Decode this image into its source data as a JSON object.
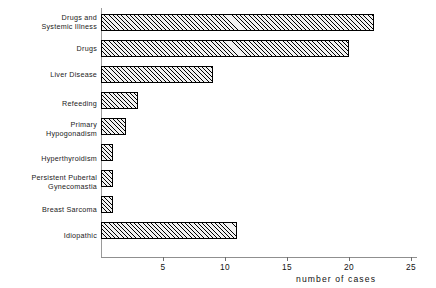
{
  "chart_data": {
    "type": "bar",
    "orientation": "horizontal",
    "title": "",
    "xlabel": "number of cases",
    "ylabel": "",
    "xlim": [
      0,
      27
    ],
    "xticks": [
      5,
      10,
      15,
      20,
      25
    ],
    "xtick_labels": [
      "5",
      "10",
      "15",
      "20",
      "25"
    ],
    "grid": false,
    "legend": null,
    "categories": [
      "Drugs and\nSystemic Illness",
      "Drugs",
      "Liver Disease",
      "Refeeding",
      "Primary\nHypogonadism",
      "Hyperthyroidism",
      "Persistent Pubertal\nGynecomastia",
      "Breast Sarcoma",
      "Idiopathic"
    ],
    "values": [
      22,
      20,
      9,
      3,
      2,
      1,
      1,
      1,
      11
    ],
    "bar_style": {
      "fill": "diagonal-hatch",
      "edge_color": "#000000",
      "face_color": "#f2f2f2"
    }
  }
}
